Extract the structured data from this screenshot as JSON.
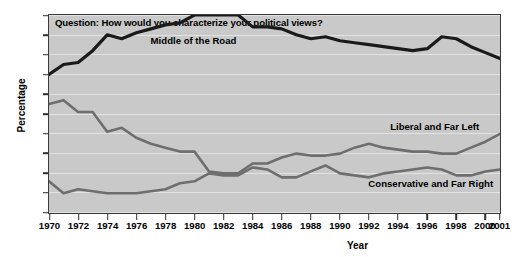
{
  "chart_data": {
    "type": "line",
    "title": "Question: How would you characterize your political views?",
    "xlabel": "Year",
    "ylabel": "Percentage",
    "xlim": [
      1970,
      2001
    ],
    "ylim": [
      10,
      60
    ],
    "ytick_step": 5,
    "grid": true,
    "legend_position": "inline-labels",
    "xticks": [
      "1970",
      "1972",
      "1974",
      "1976",
      "1978",
      "1980",
      "1982",
      "1984",
      "1986",
      "1988",
      "1990",
      "1992",
      "1994",
      "1996",
      "1998",
      "2000",
      "2001"
    ],
    "yticks": [
      "10",
      "15",
      "20",
      "25",
      "30",
      "35",
      "40",
      "45",
      "50",
      "55",
      "60"
    ],
    "x": [
      1970,
      1971,
      1972,
      1973,
      1974,
      1975,
      1976,
      1977,
      1978,
      1979,
      1980,
      1981,
      1982,
      1983,
      1984,
      1985,
      1986,
      1987,
      1988,
      1989,
      1990,
      1991,
      1992,
      1993,
      1994,
      1995,
      1996,
      1997,
      1998,
      1999,
      2000,
      2001
    ],
    "series": [
      {
        "name": "Middle of the Road",
        "color": "#1a1a1a",
        "values": [
          45.0,
          47.5,
          48.0,
          51.0,
          55.0,
          54.0,
          55.5,
          56.5,
          57.5,
          58.0,
          60.0,
          60.0,
          60.0,
          60.0,
          57.0,
          57.0,
          56.5,
          55.0,
          54.0,
          54.5,
          53.5,
          53.0,
          52.5,
          52.0,
          51.5,
          51.0,
          51.5,
          54.5,
          54.0,
          52.0,
          50.5,
          49.0
        ],
        "label_x": 1977.0,
        "label_y": 53.5
      },
      {
        "name": "Liberal and Far Left",
        "color": "#6e6e6e",
        "values": [
          37.5,
          38.5,
          35.5,
          35.5,
          30.5,
          31.5,
          29.0,
          27.5,
          26.5,
          25.5,
          25.5,
          20.5,
          20.0,
          20.0,
          22.5,
          22.5,
          24.0,
          25.0,
          24.5,
          24.5,
          25.0,
          26.5,
          27.5,
          26.5,
          26.0,
          25.5,
          25.5,
          25.0,
          25.0,
          26.5,
          28.0,
          30.0
        ],
        "label_x": 1993.5,
        "label_y": 31.5
      },
      {
        "name": "Conservative and Far Right",
        "color": "#6e6e6e",
        "values": [
          18.0,
          15.0,
          16.0,
          15.5,
          15.0,
          15.0,
          15.0,
          15.5,
          16.0,
          17.5,
          18.0,
          20.0,
          19.5,
          19.5,
          21.5,
          21.0,
          19.0,
          19.0,
          20.5,
          22.0,
          20.0,
          19.5,
          19.0,
          20.0,
          20.5,
          21.0,
          21.5,
          21.0,
          19.5,
          19.5,
          20.5,
          21.0
        ],
        "label_x": 1992.0,
        "label_y": 17.0
      }
    ]
  },
  "colors": {
    "plot_background": "#c9c9c9",
    "grid": "#e2e2e2",
    "axis": "#3a3a3a",
    "page_background": "#ffffff"
  }
}
